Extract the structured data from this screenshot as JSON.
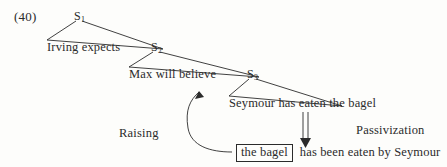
{
  "figure": {
    "example_number": "(40)",
    "tree": {
      "nodes": [
        {
          "id": "s1",
          "label": "S",
          "subscript": "1"
        },
        {
          "id": "s2",
          "label": "S",
          "subscript": "2"
        },
        {
          "id": "s3",
          "label": "S",
          "subscript": "3"
        }
      ],
      "clauses": [
        {
          "id": "clause-1",
          "text": "Irving expects"
        },
        {
          "id": "clause-2",
          "text": "Max will believe"
        },
        {
          "id": "clause-3",
          "text": "Seymour has eaten the bagel"
        }
      ]
    },
    "operations": [
      {
        "id": "raising",
        "label": "Raising"
      },
      {
        "id": "passivization",
        "label": "Passivization"
      }
    ],
    "result": {
      "moved_constituent": "the bagel",
      "remainder": "has been eaten by Seymour"
    },
    "colors": {
      "ink": "#2b2b2b",
      "paper": "#fdfdfb"
    }
  }
}
